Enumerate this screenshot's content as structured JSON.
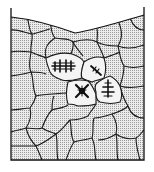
{
  "figure": {
    "type": "schematic",
    "colors": {
      "background": "#ffffff",
      "cell_fill": "#d9d9d9",
      "outline": "#1a1a1a",
      "crystal": "#111111"
    },
    "container": {
      "walls": [
        "left",
        "right",
        "bottom"
      ],
      "top_surface": "curved meniscus, dipping in the middle"
    },
    "nucleating_cells": [
      {
        "id": "A",
        "crystal_shape": "double-cross dendrite (#-like)"
      },
      {
        "id": "B",
        "crystal_shape": "small diagonal dendrite"
      },
      {
        "id": "C",
        "crystal_shape": "X-shaped crystal"
      },
      {
        "id": "D",
        "crystal_shape": "tree-like dendrite"
      }
    ]
  }
}
